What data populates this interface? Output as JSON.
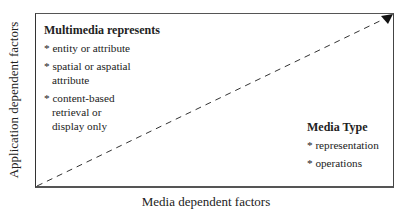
{
  "diagram": {
    "y_axis_label": "Application dependent factors",
    "x_axis_label": "Media dependent factors",
    "left_block": {
      "heading": "Multimedia represents",
      "items": [
        "* entity or attribute",
        "* spatial or aspatial attribute",
        "* content-based retrieval or display only"
      ]
    },
    "right_block": {
      "heading": "Media Type",
      "items": [
        "* representation",
        "* operations"
      ]
    },
    "arrow": {
      "style": "dashed",
      "from": "bottom-left",
      "to": "top-right"
    }
  }
}
